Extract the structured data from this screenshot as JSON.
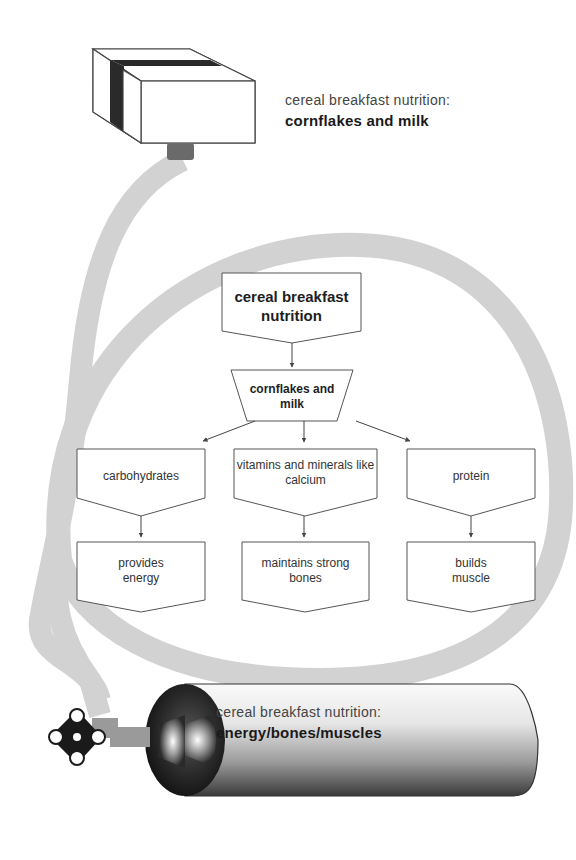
{
  "top_caption": {
    "line1": "cereal breakfast nutrition:",
    "line2": "cornflakes and milk"
  },
  "bottom_caption": {
    "line1": "cereal breakfast nutrition:",
    "line2": "energy/bones/muscles"
  },
  "flowchart": {
    "root": "cereal breakfast nutrition",
    "food": "cornflakes and milk",
    "nutrients": [
      {
        "name": "carbohydrates",
        "benefit": "provides energy"
      },
      {
        "name": "vitamins and minerals like calcium",
        "benefit": "maintains strong bones"
      },
      {
        "name": "protein",
        "benefit": "builds muscle"
      }
    ]
  },
  "colors": {
    "tube": "#d2d2d2",
    "outline": "#555555",
    "box_stripe": "#2a2a2a",
    "cylinder_dark": "#333333",
    "cylinder_light": "#f4f4f4"
  }
}
